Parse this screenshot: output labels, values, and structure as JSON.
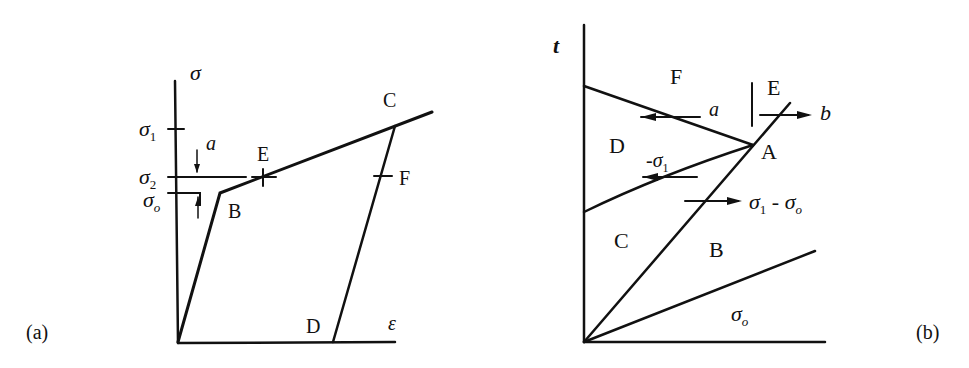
{
  "figure_a": {
    "panel_label": "(a)",
    "y_axis_label": "σ",
    "x_axis_label": "ε",
    "y_ticks": [
      {
        "symbol": "σ",
        "subscript": "1",
        "y": 129
      },
      {
        "symbol": "σ",
        "subscript": "2",
        "y": 177
      },
      {
        "symbol": "σ",
        "subscript": "o",
        "y": 193
      }
    ],
    "points": {
      "B": "B",
      "C": "C",
      "D": "D",
      "E": "E",
      "F": "F"
    },
    "annotation_a": "a",
    "description": "Bilinear stress-strain curve: elastic O→B, hardening B→C, unloading C→D; E and F are marks on hardening and unloading branches; a denotes gap between σ2 and σo"
  },
  "figure_b": {
    "panel_label": "(b)",
    "y_axis_label": "t",
    "regions": {
      "A": "A",
      "B": "B",
      "C": "C",
      "D": "D",
      "E": "E",
      "F": "F"
    },
    "wave_labels": {
      "a": "a",
      "b": "b",
      "minus_sigma1": "-σ",
      "minus_sigma1_sub": "1",
      "sigma1_minus_sigma0": "σ",
      "sigma1_minus_sigma0_sub1": "1",
      "sigma1_minus_sigma0_mid": " - σ",
      "sigma1_minus_sigma0_sub2": "o",
      "sigma0": "σ",
      "sigma0_sub": "o"
    },
    "description": "Time-distance wave diagram with characteristics from origin and reflected waves meeting at A"
  }
}
